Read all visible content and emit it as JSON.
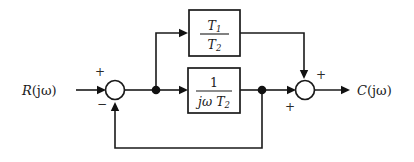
{
  "diagram": {
    "background_color": "#ffffff",
    "line_color": "#1a1a1a",
    "signals": {
      "input_label": "R(jω)",
      "input_var": "R",
      "input_arg": "(jω)",
      "output_label": "C(jω)",
      "output_var": "C",
      "output_arg": "(jω)"
    },
    "blocks": [
      {
        "id": "gain-block",
        "numerator": "T",
        "numerator_sub": "1",
        "denominator": "T",
        "denominator_sub": "2",
        "expression": "T1/T2"
      },
      {
        "id": "integrator-block",
        "numerator": "1",
        "denominator": "jω T",
        "denominator_sub": "2",
        "expression": "1/(jω T2)"
      }
    ],
    "summing_junctions": [
      {
        "id": "left-sum",
        "sign_input": "+",
        "sign_feedback": "−"
      },
      {
        "id": "right-sum",
        "sign_top": "+",
        "sign_left": "+"
      }
    ]
  }
}
